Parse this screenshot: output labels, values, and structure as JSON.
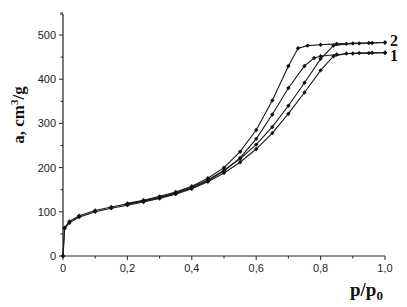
{
  "chart_data": {
    "type": "line",
    "title": "",
    "xlabel": "p/p0",
    "ylabel": "a, cm3/g",
    "xlim": [
      0,
      1.0
    ],
    "ylim": [
      0,
      550
    ],
    "xticks": [
      "0",
      "0,2",
      "0,4",
      "0,6",
      "0,8",
      "1,0"
    ],
    "yticks": [
      "0",
      "100",
      "200",
      "300",
      "400",
      "500"
    ],
    "grid": false,
    "legend": "curve-end labels",
    "series": [
      {
        "name": "1",
        "branch": "adsorption",
        "x": [
          0,
          0.005,
          0.02,
          0.05,
          0.1,
          0.15,
          0.2,
          0.25,
          0.3,
          0.35,
          0.4,
          0.45,
          0.5,
          0.55,
          0.6,
          0.65,
          0.7,
          0.75,
          0.8,
          0.84,
          0.88,
          0.92,
          0.96,
          1.0
        ],
        "y": [
          0,
          62,
          75,
          88,
          100,
          108,
          115,
          122,
          130,
          140,
          152,
          168,
          188,
          212,
          242,
          278,
          322,
          370,
          420,
          452,
          458,
          459,
          460,
          460
        ]
      },
      {
        "name": "1",
        "branch": "desorption",
        "x": [
          1.0,
          0.95,
          0.9,
          0.85,
          0.8,
          0.78,
          0.75,
          0.7,
          0.65,
          0.6,
          0.55,
          0.5,
          0.45,
          0.4,
          0.35,
          0.3,
          0.25,
          0.2
        ],
        "y": [
          460,
          459,
          458,
          456,
          452,
          448,
          430,
          380,
          320,
          265,
          222,
          192,
          170,
          154,
          142,
          132,
          124,
          117
        ]
      },
      {
        "name": "2",
        "branch": "adsorption",
        "x": [
          0,
          0.005,
          0.02,
          0.05,
          0.1,
          0.15,
          0.2,
          0.25,
          0.3,
          0.35,
          0.4,
          0.45,
          0.5,
          0.55,
          0.6,
          0.65,
          0.7,
          0.75,
          0.8,
          0.84,
          0.88,
          0.92,
          0.96,
          1.0
        ],
        "y": [
          0,
          64,
          78,
          91,
          103,
          111,
          118,
          125,
          133,
          143,
          156,
          172,
          194,
          220,
          252,
          292,
          340,
          392,
          446,
          476,
          480,
          481,
          482,
          483
        ]
      },
      {
        "name": "2",
        "branch": "desorption",
        "x": [
          1.0,
          0.95,
          0.9,
          0.85,
          0.8,
          0.76,
          0.73,
          0.7,
          0.65,
          0.6,
          0.55,
          0.5,
          0.45,
          0.4,
          0.35,
          0.3,
          0.25,
          0.2
        ],
        "y": [
          483,
          482,
          481,
          480,
          478,
          476,
          470,
          430,
          352,
          285,
          236,
          200,
          176,
          158,
          145,
          135,
          126,
          119
        ]
      }
    ],
    "annotations": [
      {
        "text": "2",
        "x": 1.02,
        "y": 490
      },
      {
        "text": "1",
        "x": 1.02,
        "y": 455
      }
    ]
  },
  "labels": {
    "ylabel_main": "a, cm",
    "ylabel_sup": "3",
    "ylabel_tail": "/g",
    "xlabel_main": "p/p",
    "xlabel_sub": "0",
    "series2": "2",
    "series1": "1"
  }
}
